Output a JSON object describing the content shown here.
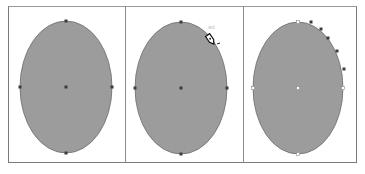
{
  "figure": {
    "colors": {
      "ellipse_fill": "#9c9c9c",
      "ellipse_stroke": "#6e6e6e",
      "anchor_dark": "#3c3c3c",
      "anchor_hollow_fill": "#ffffff",
      "frame_border": "#7a7a7a",
      "background": "#ffffff"
    },
    "panels": [
      {
        "id": "panel-1",
        "step": "Selected ellipse",
        "ellipse": {
          "cx": 66,
          "cy": 87,
          "rx": 46,
          "ry": 66
        },
        "anchors": [
          {
            "x": 66,
            "y": 21,
            "style": "dark"
          },
          {
            "x": 20,
            "y": 87,
            "style": "dark"
          },
          {
            "x": 112,
            "y": 87,
            "style": "dark"
          },
          {
            "x": 66,
            "y": 153,
            "style": "dark"
          },
          {
            "x": 66,
            "y": 87,
            "style": "dark"
          }
        ]
      },
      {
        "id": "panel-2",
        "step": "Pen tool on path",
        "ellipse": {
          "cx": 181,
          "cy": 88,
          "rx": 46,
          "ry": 66
        },
        "anchors": [
          {
            "x": 181,
            "y": 22,
            "style": "dark"
          },
          {
            "x": 135,
            "y": 88,
            "style": "dark"
          },
          {
            "x": 227,
            "y": 88,
            "style": "dark"
          },
          {
            "x": 181,
            "y": 154,
            "style": "dark"
          },
          {
            "x": 181,
            "y": 88,
            "style": "dark"
          }
        ],
        "cursor": {
          "type": "pen-tool",
          "x": 211,
          "y": 40
        },
        "cursor_label": "ad"
      },
      {
        "id": "panel-3",
        "step": "Added anchor points",
        "ellipse": {
          "cx": 298,
          "cy": 88,
          "rx": 45,
          "ry": 66
        },
        "anchors": [
          {
            "x": 298,
            "y": 22,
            "style": "hollow"
          },
          {
            "x": 253,
            "y": 88,
            "style": "hollow"
          },
          {
            "x": 343,
            "y": 88,
            "style": "hollow"
          },
          {
            "x": 298,
            "y": 154,
            "style": "hollow"
          },
          {
            "x": 298,
            "y": 88,
            "style": "hollow"
          },
          {
            "x": 311,
            "y": 22,
            "style": "dark"
          },
          {
            "x": 321,
            "y": 29,
            "style": "dark"
          },
          {
            "x": 328,
            "y": 38,
            "style": "dark"
          },
          {
            "x": 337,
            "y": 51,
            "style": "dark"
          },
          {
            "x": 344,
            "y": 69,
            "style": "dark"
          }
        ]
      }
    ]
  }
}
